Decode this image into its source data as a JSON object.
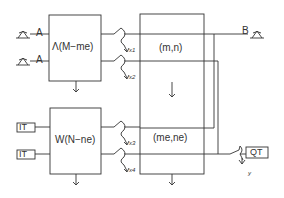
{
  "diagram": {
    "inputs_top": [
      {
        "label": "A",
        "icon": "source-icon"
      },
      {
        "label": "A",
        "icon": "source-icon"
      }
    ],
    "inputs_bottom": [
      {
        "label": "IT"
      },
      {
        "label": "IT"
      }
    ],
    "box_top": {
      "label": "Λ(M−me)"
    },
    "box_bottom": {
      "label": "W(N−ne)"
    },
    "switch_labels": [
      "x1",
      "x2",
      "x3",
      "x4"
    ],
    "switch_sub": {
      "x": "x",
      "s1": "1",
      "s2": "2",
      "s3": "3",
      "s4": "4"
    },
    "center_box": {
      "upper_label": "(m,n)",
      "lower_label": "(me,ne)",
      "arrow": "↓"
    },
    "output_b": {
      "label": "B",
      "icon": "sink-icon"
    },
    "output_qt": {
      "label": "QT",
      "switch_label": "y"
    },
    "down_arrow": "↓",
    "colors": {
      "line": "#333333",
      "background": "#ffffff"
    }
  }
}
